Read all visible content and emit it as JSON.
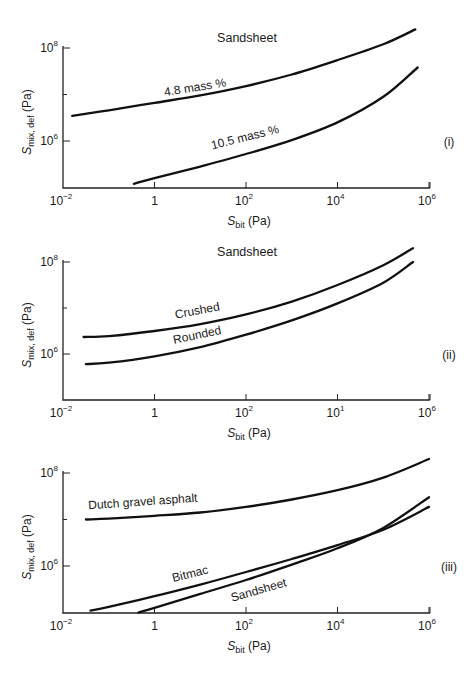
{
  "figure": {
    "panels": [
      {
        "id": "(i)",
        "title": "Sandsheet",
        "xlabel_main": "S",
        "xlabel_sub": "bit",
        "xlabel_unit": " (Pa)",
        "ylabel_main": "S",
        "ylabel_sub": "mix, def",
        "ylabel_unit": " (Pa)"
      },
      {
        "id": "(ii)",
        "title": "Sandsheet",
        "xlabel_main": "S",
        "xlabel_sub": "bit",
        "xlabel_unit": " (Pa)",
        "ylabel_main": "S",
        "ylabel_sub": "mix, def",
        "ylabel_unit": " (Pa)"
      },
      {
        "id": "(iii)",
        "title": "",
        "xlabel_main": "S",
        "xlabel_sub": "bit",
        "xlabel_unit": " (Pa)",
        "ylabel_main": "S",
        "ylabel_sub": "mix, def",
        "ylabel_unit": " (Pa)"
      }
    ]
  },
  "chart_data": [
    {
      "type": "line",
      "panel": "(i)",
      "title": "Sandsheet",
      "xlabel": "S_bit (Pa)",
      "ylabel": "S_mix, def (Pa)",
      "xscale": "log",
      "yscale": "log",
      "xlim_log10": [
        -2,
        6
      ],
      "ylim_log10": [
        5,
        8.6
      ],
      "x_ticks": [
        {
          "base": "10",
          "exp": "−2"
        },
        {
          "base": "1",
          "exp": ""
        },
        {
          "base": "10",
          "exp": "2"
        },
        {
          "base": "10",
          "exp": "4"
        },
        {
          "base": "10",
          "exp": "6"
        }
      ],
      "y_ticks": [
        {
          "base": "10",
          "exp": "8",
          "log": 8
        },
        {
          "base": "10",
          "exp": "6",
          "log": 6
        }
      ],
      "y_minor_ticks_log": [
        7
      ],
      "grid": false,
      "legend": "inline labels",
      "series": [
        {
          "name": "4.8 mass %",
          "x_log10": [
            -1.8,
            -1,
            0,
            1,
            2,
            3,
            4,
            5,
            5.7
          ],
          "y_log10": [
            6.54,
            6.66,
            6.82,
            6.98,
            7.18,
            7.43,
            7.74,
            8.08,
            8.4
          ],
          "label_pos": {
            "x_log10": 0.9,
            "y_log10": 7.07,
            "angle": -9
          }
        },
        {
          "name": "10.5 mass %",
          "x_log10": [
            -0.45,
            0,
            1,
            2,
            3,
            4,
            5,
            5.75
          ],
          "y_log10": [
            5.08,
            5.2,
            5.45,
            5.72,
            6.02,
            6.4,
            6.95,
            7.58
          ],
          "label_pos": {
            "x_log10": 2.0,
            "y_log10": 6.0,
            "angle": -14
          }
        }
      ]
    },
    {
      "type": "line",
      "panel": "(ii)",
      "title": "Sandsheet",
      "xlabel": "S_bit (Pa)",
      "ylabel": "S_mix, def (Pa)",
      "xscale": "log",
      "yscale": "log",
      "xlim_log10": [
        -2,
        6
      ],
      "ylim_log10": [
        5,
        8.6
      ],
      "x_ticks": [
        {
          "base": "10",
          "exp": "−2"
        },
        {
          "base": "1",
          "exp": ""
        },
        {
          "base": "10",
          "exp": "2"
        },
        {
          "base": "10",
          "exp": "1"
        },
        {
          "base": "10",
          "exp": "6"
        }
      ],
      "y_ticks": [
        {
          "base": "10",
          "exp": "8",
          "log": 8
        },
        {
          "base": "10",
          "exp": "6",
          "log": 6
        }
      ],
      "y_minor_ticks_log": [
        7
      ],
      "grid": false,
      "legend": "inline labels",
      "series": [
        {
          "name": "Crushed",
          "x_log10": [
            -1.55,
            -1,
            0,
            1,
            2,
            3,
            4,
            5,
            5.65
          ],
          "y_log10": [
            6.37,
            6.39,
            6.5,
            6.65,
            6.86,
            7.14,
            7.5,
            7.93,
            8.3
          ],
          "label_pos": {
            "x_log10": 0.95,
            "y_log10": 6.86,
            "angle": -11
          }
        },
        {
          "name": "Rounded",
          "x_log10": [
            -1.5,
            -1,
            0,
            1,
            2,
            3,
            4,
            5,
            5.65
          ],
          "y_log10": [
            5.78,
            5.81,
            5.95,
            6.15,
            6.42,
            6.73,
            7.1,
            7.55,
            8.0
          ],
          "label_pos": {
            "x_log10": 0.95,
            "y_log10": 6.33,
            "angle": -12
          }
        }
      ]
    },
    {
      "type": "line",
      "panel": "(iii)",
      "title": "",
      "xlabel": "S_bit (Pa)",
      "ylabel": "S_mix, def (Pa)",
      "xscale": "log",
      "yscale": "log",
      "xlim_log10": [
        -2,
        6
      ],
      "ylim_log10": [
        5,
        8.6
      ],
      "x_ticks": [
        {
          "base": "10",
          "exp": "−2"
        },
        {
          "base": "1",
          "exp": ""
        },
        {
          "base": "10",
          "exp": "2"
        },
        {
          "base": "10",
          "exp": "4"
        },
        {
          "base": "10",
          "exp": "6"
        }
      ],
      "y_ticks": [
        {
          "base": "10",
          "exp": "8",
          "log": 8
        },
        {
          "base": "10",
          "exp": "6",
          "log": 6
        }
      ],
      "y_minor_ticks_log": [
        7
      ],
      "grid": false,
      "legend": "inline labels",
      "series": [
        {
          "name": "Dutch gravel asphalt",
          "x_log10": [
            -1.5,
            -1,
            0,
            1,
            2,
            3,
            4,
            5,
            6
          ],
          "y_log10": [
            7.0,
            7.02,
            7.08,
            7.15,
            7.27,
            7.43,
            7.63,
            7.9,
            8.3
          ],
          "label_pos": {
            "x_log10": -0.25,
            "y_log10": 7.3,
            "angle": -4
          }
        },
        {
          "name": "Bitmac",
          "x_log10": [
            -1.4,
            -1,
            0,
            1,
            2,
            3,
            4,
            5,
            6
          ],
          "y_log10": [
            5.04,
            5.12,
            5.35,
            5.6,
            5.87,
            6.15,
            6.45,
            6.78,
            7.27
          ],
          "label_pos": {
            "x_log10": 0.8,
            "y_log10": 5.75,
            "angle": -14
          }
        },
        {
          "name": "Sandsheet",
          "x_log10": [
            -0.35,
            0,
            1,
            2,
            3,
            4,
            5,
            6
          ],
          "y_log10": [
            5.0,
            5.1,
            5.4,
            5.7,
            6.03,
            6.38,
            6.82,
            7.48
          ],
          "label_pos": {
            "x_log10": 2.3,
            "y_log10": 5.4,
            "angle": -16
          }
        }
      ]
    }
  ]
}
